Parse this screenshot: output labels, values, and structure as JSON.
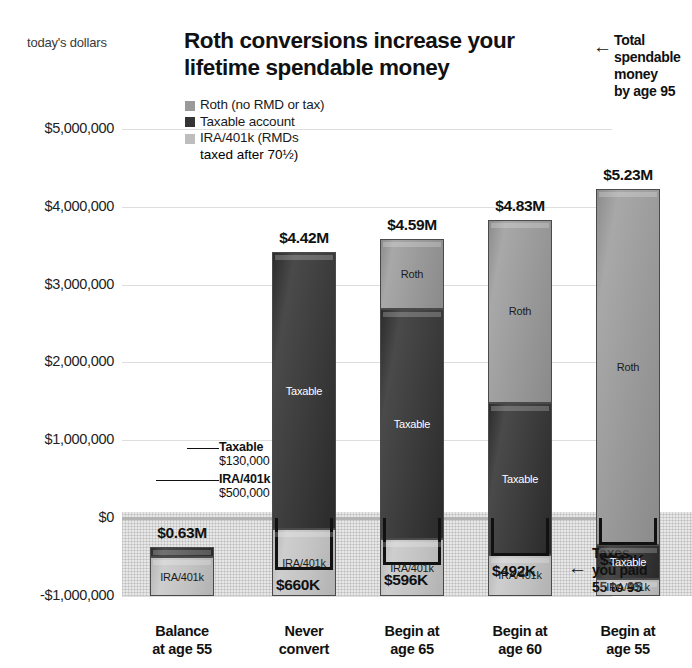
{
  "header": {
    "units_label": "today's dollars",
    "title": "Roth conversions increase your lifetime spendable money"
  },
  "legend": {
    "items": [
      {
        "name": "roth",
        "label": "Roth (no RMD or tax)",
        "sub": "",
        "color": "#9a9a9a"
      },
      {
        "name": "taxable",
        "label": "Taxable account",
        "sub": "",
        "color": "#343434"
      },
      {
        "name": "ira",
        "label": "IRA/401k (RMDs",
        "sub": "taxed after 70½)",
        "color": "#bdbdbd"
      }
    ]
  },
  "annotations": {
    "total_spendable": "Total spendable money by age 95",
    "total_spendable_lines": [
      "Total",
      "spendable",
      "money",
      "by age 95"
    ],
    "taxes_paid": "Taxes you paid 55 to 95",
    "taxes_paid_lines": [
      "Taxes",
      "you paid",
      "55 to 95"
    ],
    "arrow_glyph": "←"
  },
  "first_bar_callouts": [
    {
      "name": "taxable",
      "label": "Taxable",
      "value": "$130,000"
    },
    {
      "name": "ira",
      "label": "IRA/401k",
      "value": "$500,000"
    }
  ],
  "chart_data": {
    "type": "bar",
    "title": "Roth conversions increase your lifetime spendable money",
    "subtitle": "today's dollars",
    "xlabel": "",
    "ylabel": "today's dollars",
    "ylim": [
      -1000000,
      5500000
    ],
    "grid": true,
    "legend_position": "top-left",
    "yticks": [
      5000000,
      4000000,
      3000000,
      2000000,
      1000000,
      0,
      -1000000
    ],
    "ytick_labels": [
      "$5,000,000",
      "$4,000,000",
      "$3,000,000",
      "$2,000,000",
      "$1,000,000",
      "$0",
      "-$1,000,000"
    ],
    "categories": [
      "Balance at age 55",
      "Never convert",
      "Begin at age 65",
      "Begin at age 60",
      "Begin at age 55"
    ],
    "category_label_lines": [
      [
        "Balance",
        "at age 55"
      ],
      [
        "Never",
        "convert"
      ],
      [
        "Begin at",
        "age 65"
      ],
      [
        "Begin at",
        "age 60"
      ],
      [
        "Begin at",
        "age 55"
      ]
    ],
    "series": [
      {
        "name": "Roth (no RMD or tax)",
        "key": "roth",
        "color": "#9a9a9a",
        "values": [
          0,
          0,
          900000,
          2350000,
          4570000
        ]
      },
      {
        "name": "Taxable account",
        "key": "taxable",
        "color": "#343434",
        "values": [
          130000,
          3560000,
          2960000,
          1950000,
          440000
        ]
      },
      {
        "name": "IRA/401k (RMDs taxed after 70½)",
        "key": "ira",
        "color": "#bdbdbd",
        "values": [
          500000,
          860000,
          730000,
          530000,
          220000
        ]
      }
    ],
    "totals": [
      630000,
      4420000,
      4590000,
      4830000,
      5230000
    ],
    "total_labels": [
      "$0.63M",
      "$4.42M",
      "$4.59M",
      "$4.83M",
      "$5.23M"
    ],
    "taxes_paid": [
      null,
      -660000,
      -596000,
      -492000,
      -342000
    ],
    "taxes_paid_labels": [
      null,
      "$660K",
      "$596K",
      "$492K",
      "$342K"
    ],
    "segment_labels": {
      "roth": "Roth",
      "taxable": "Taxable",
      "ira": "IRA/401k"
    }
  }
}
